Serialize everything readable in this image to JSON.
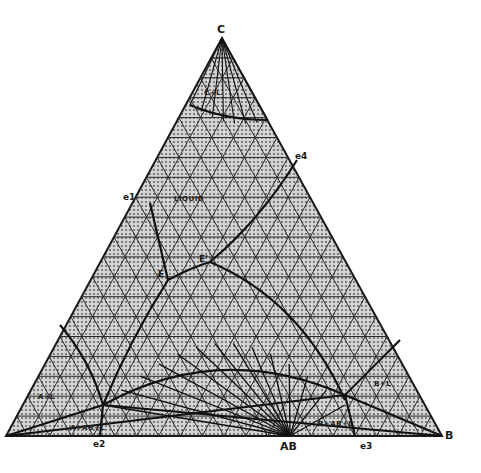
{
  "diagram": {
    "type": "ternary phase diagram",
    "vertices": {
      "top": "C",
      "left": "A",
      "right": "B"
    },
    "compound": "AB",
    "points": {
      "e1": "e1",
      "e2": "e2",
      "e3": "e3",
      "e4": "e4",
      "E": "E",
      "E_prime": "E'"
    },
    "regions": {
      "liquid": "LIQUID",
      "c_liquid": "C+L",
      "a_liquid": "A+L",
      "b_liquid": "B+L",
      "a_ab_liquid": "A+AB+L",
      "b_ab_liquid": "B+AB+L"
    },
    "colors": {
      "line": "#1a1a1a",
      "fill": "#c8c8c8",
      "dots": "#555555",
      "background": "#ffffff"
    }
  }
}
